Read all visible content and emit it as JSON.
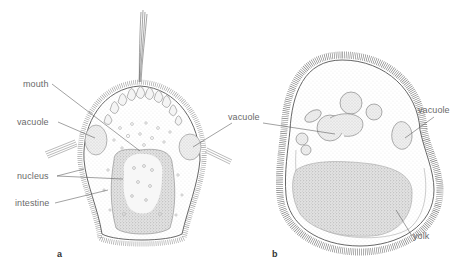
{
  "figure": {
    "panels": [
      {
        "id": "a",
        "letter": "a",
        "labels": {
          "mouth": "mouth",
          "vacuole": "vacuole",
          "nucleus": "nucleus",
          "intestine": "intestine"
        }
      },
      {
        "id": "b",
        "letter": "b",
        "labels": {
          "vacuole_left": "vacuole",
          "vacuole_right": "vacuole",
          "yolk": "yolk"
        }
      }
    ],
    "colors": {
      "ink": "#555555",
      "label_text": "#6a6a6a",
      "leader_line": "#555555",
      "stipple_dark": "#8a8a8a",
      "background": "#ffffff"
    }
  }
}
